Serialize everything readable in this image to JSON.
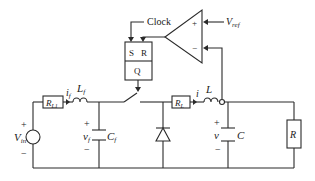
{
  "diagram": {
    "type": "circuit-schematic",
    "labels": {
      "clock": "Clock",
      "vref_main": "V",
      "vref_sub": "ref",
      "opamp_plus": "+",
      "opamp_minus": "−",
      "latch_s": "S",
      "latch_r": "R",
      "latch_q": "Q",
      "vin_main": "V",
      "vin_sub": "in",
      "vin_plus": "+",
      "vin_minus": "−",
      "rl1_main": "R",
      "rl1_sub": "L1",
      "if_main": "i",
      "if_sub": "f",
      "lf_main": "L",
      "lf_sub": "f",
      "vf_main": "v",
      "vf_sub": "f",
      "vf_plus": "+",
      "vf_minus": "−",
      "cf_main": "C",
      "cf_sub": "f",
      "rl_main": "R",
      "rl_sub": "L",
      "i_label": "i",
      "l_label": "L",
      "v_label": "v",
      "v_plus": "+",
      "v_minus": "−",
      "c_label": "C",
      "r_label": "R"
    },
    "components": [
      {
        "id": "Vin",
        "kind": "voltage-source"
      },
      {
        "id": "RL1",
        "kind": "resistor"
      },
      {
        "id": "Lf",
        "kind": "inductor"
      },
      {
        "id": "Cf",
        "kind": "capacitor"
      },
      {
        "id": "switch",
        "kind": "switch"
      },
      {
        "id": "diode",
        "kind": "diode"
      },
      {
        "id": "RL",
        "kind": "resistor"
      },
      {
        "id": "L",
        "kind": "inductor"
      },
      {
        "id": "C",
        "kind": "capacitor"
      },
      {
        "id": "R",
        "kind": "resistor"
      },
      {
        "id": "comparator",
        "kind": "op-amp"
      },
      {
        "id": "latch",
        "kind": "SR-latch"
      }
    ]
  }
}
